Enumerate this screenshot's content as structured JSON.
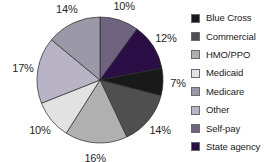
{
  "chart_data": {
    "type": "pie",
    "title": "",
    "subtitle": "",
    "xlabel": "",
    "ylabel": "",
    "legend_position": "right",
    "grid": false,
    "start_angle_deg": 0,
    "direction": "clockwise",
    "categories": [
      "Self-pay",
      "State agency",
      "Blue Cross",
      "Commercial",
      "HMO/PPO",
      "Medicaid",
      "Other",
      "Medicare"
    ],
    "values": [
      10,
      12,
      7,
      14,
      16,
      10,
      17,
      14
    ],
    "value_labels": [
      "10%",
      "12%",
      "7%",
      "14%",
      "16%",
      "10%",
      "17%",
      "14%"
    ],
    "colors": [
      "#6e6480",
      "#2b0e46",
      "#191919",
      "#4f4f4f",
      "#b0b0b0",
      "#e2e2e2",
      "#b9b3c6",
      "#9b98a8"
    ],
    "slices": [
      {
        "label": "Self-pay",
        "value": 10,
        "value_label": "10%",
        "color": "#6e6480"
      },
      {
        "label": "State agency",
        "value": 12,
        "value_label": "12%",
        "color": "#2b0e46"
      },
      {
        "label": "Blue Cross",
        "value": 7,
        "value_label": "7%",
        "color": "#191919"
      },
      {
        "label": "Commercial",
        "value": 14,
        "value_label": "14%",
        "color": "#4f4f4f"
      },
      {
        "label": "HMO/PPO",
        "value": 16,
        "value_label": "16%",
        "color": "#b0b0b0"
      },
      {
        "label": "Medicaid",
        "value": 10,
        "value_label": "10%",
        "color": "#e2e2e2"
      },
      {
        "label": "Other",
        "value": 17,
        "value_label": "17%",
        "color": "#b9b3c6"
      },
      {
        "label": "Medicare",
        "value": 14,
        "value_label": "14%",
        "color": "#9b98a8"
      }
    ]
  },
  "legend": {
    "items": [
      {
        "label": "Blue Cross",
        "color": "#191919"
      },
      {
        "label": "Commercial",
        "color": "#4f4f4f"
      },
      {
        "label": "HMO/PPO",
        "color": "#b0b0b0"
      },
      {
        "label": "Medicaid",
        "color": "#e2e2e2"
      },
      {
        "label": "Medicare",
        "color": "#9b98a8"
      },
      {
        "label": "Other",
        "color": "#b9b3c6"
      },
      {
        "label": "Self-pay",
        "color": "#6e6480"
      },
      {
        "label": "State agency",
        "color": "#2b0e46"
      }
    ]
  },
  "pie_geometry": {
    "center_x": 100,
    "center_y": 80,
    "radius": 63,
    "label_radius": 78
  }
}
